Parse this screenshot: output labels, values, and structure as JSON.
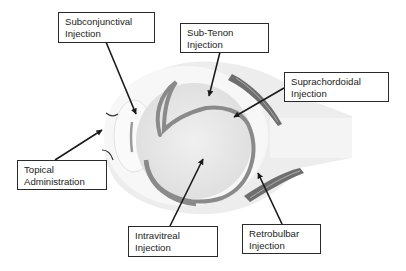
{
  "diagram": {
    "type": "labeled anatomical diagram",
    "colors": {
      "background": "#ffffff",
      "orbit_tissue": "#ececec",
      "sclera": "#f6f6f6",
      "vitreous": "#e6e6e6",
      "choroid_line": "#8a8a8a",
      "muscle": "#6e6e6e",
      "arrow": "#1a1a1a",
      "box_border": "#2a2a2a",
      "text": "#222222"
    },
    "labels": [
      {
        "id": "subconjunctival",
        "line1": "Subconjunctival",
        "line2": "Injection"
      },
      {
        "id": "sub-tenon",
        "line1": "Sub-Tenon",
        "line2": "Injection"
      },
      {
        "id": "suprachordoidal",
        "line1": "Suprachordoidal",
        "line2": "Injection"
      },
      {
        "id": "topical",
        "line1": "Topical",
        "line2": "Administration"
      },
      {
        "id": "intravitreal",
        "line1": "Intravitreal",
        "line2": "Injection"
      },
      {
        "id": "retrobulbar",
        "line1": "Retrobulbar",
        "line2": "Injection"
      }
    ]
  }
}
